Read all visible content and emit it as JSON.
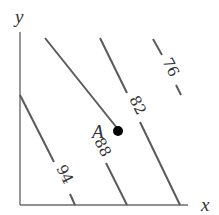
{
  "diagram": {
    "type": "contour-plot",
    "axes": {
      "x_label": "x",
      "y_label": "y"
    },
    "contours": [
      {
        "value": "94",
        "label_rotation": 63
      },
      {
        "value": "88",
        "label_rotation": 63
      },
      {
        "value": "82",
        "label_rotation": 63
      },
      {
        "value": "76",
        "label_rotation": 63
      }
    ],
    "point": {
      "label": "A"
    },
    "colors": {
      "lines": "#5a5a5a",
      "axes": "#6b6b6b",
      "point": "#000000",
      "background": "#ffffff"
    }
  }
}
